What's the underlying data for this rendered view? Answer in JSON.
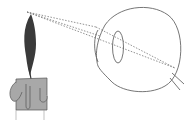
{
  "diagram": {
    "title": "",
    "subjects": [
      "candle",
      "eye"
    ],
    "colors": {
      "flame": "#3a3a3a",
      "candle_body": "#a8a8a8",
      "outline": "#555555",
      "ray": "#777777",
      "background": "#ffffff"
    }
  }
}
